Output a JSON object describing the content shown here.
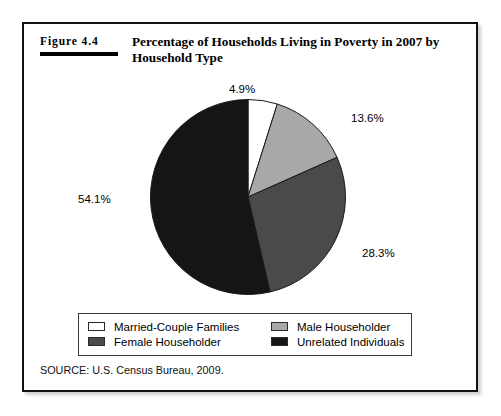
{
  "figure": {
    "number_label": "Figure 4.4",
    "title": "Percentage of Households Living in Poverty in 2007 by Household Type",
    "source": "SOURCE: U.S. Census Bureau, 2009."
  },
  "legend": {
    "items": [
      {
        "label": "Married-Couple Families",
        "color": "#ffffff"
      },
      {
        "label": "Male Householder",
        "color": "#a8a8a8"
      },
      {
        "label": "Female Householder",
        "color": "#4a4a4a"
      },
      {
        "label": "Unrelated Individuals",
        "color": "#151515"
      }
    ]
  },
  "labels": {
    "married": "4.9%",
    "male": "13.6%",
    "female": "28.3%",
    "unrelated": "54.1%"
  },
  "chart_data": {
    "type": "pie",
    "title": "Percentage of Households Living in Poverty in 2007 by Household Type",
    "categories": [
      "Married-Couple Families",
      "Male Householder",
      "Female Householder",
      "Unrelated Individuals"
    ],
    "values": [
      4.9,
      13.6,
      28.3,
      54.1
    ],
    "value_labels": [
      "4.9%",
      "13.6%",
      "28.3%",
      "54.1%"
    ],
    "colors": [
      "#ffffff",
      "#a8a8a8",
      "#4a4a4a",
      "#151515"
    ],
    "units": "percent",
    "start_angle_deg": 0,
    "direction": "clockwise",
    "legend_position": "bottom",
    "grid": false,
    "source": "SOURCE: U.S. Census Bureau, 2009."
  }
}
